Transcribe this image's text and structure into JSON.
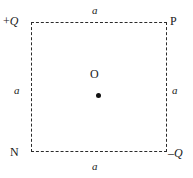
{
  "figure": {
    "background_color": "#ffffff",
    "line_color": "#2b2b2b",
    "dot_color": "#111111",
    "square": {
      "style": "dashed",
      "side_label": "a"
    },
    "corners": {
      "top_left": {
        "sign": "+",
        "charge": "Q"
      },
      "top_right": {
        "label": "P"
      },
      "bottom_left": {
        "label": "N"
      },
      "bottom_right": {
        "sign": "–",
        "charge": "Q"
      }
    },
    "center": {
      "label": "O",
      "marker": "filled-dot"
    },
    "sides": {
      "top": "a",
      "left": "a",
      "right": "a",
      "bottom": "a"
    }
  }
}
